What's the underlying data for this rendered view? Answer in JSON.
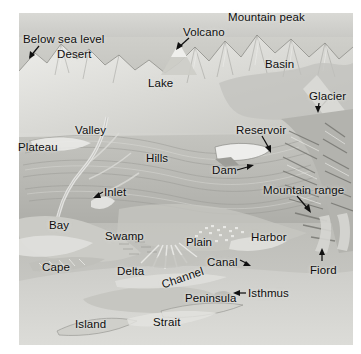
{
  "figure": {
    "type": "physical-geography-terrain-illustration",
    "background_color": "#ffffff",
    "plate_base_color": "#b9b9b6",
    "label_color": "#0d0d0d"
  },
  "labels": [
    {
      "id": "below-sea-level",
      "text": "Below sea level",
      "x": 23,
      "y": 33,
      "has_arrow": true
    },
    {
      "id": "desert",
      "text": "Desert",
      "x": 57,
      "y": 48,
      "has_arrow": false
    },
    {
      "id": "mountain-peak",
      "text": "Mountain peak",
      "x": 228,
      "y": 11,
      "has_arrow": false
    },
    {
      "id": "volcano",
      "text": "Volcano",
      "x": 183,
      "y": 26,
      "has_arrow": true
    },
    {
      "id": "basin",
      "text": "Basin",
      "x": 265,
      "y": 58,
      "has_arrow": false
    },
    {
      "id": "lake",
      "text": "Lake",
      "x": 148,
      "y": 77,
      "has_arrow": false
    },
    {
      "id": "glacier",
      "text": "Glacier",
      "x": 309,
      "y": 90,
      "has_arrow": true
    },
    {
      "id": "valley",
      "text": "Valley",
      "x": 75,
      "y": 124,
      "has_arrow": false
    },
    {
      "id": "reservoir",
      "text": "Reservoir",
      "x": 236,
      "y": 124,
      "has_arrow": true
    },
    {
      "id": "plateau",
      "text": "Plateau",
      "x": 18,
      "y": 141,
      "has_arrow": false
    },
    {
      "id": "hills",
      "text": "Hills",
      "x": 146,
      "y": 152,
      "has_arrow": false
    },
    {
      "id": "dam",
      "text": "Dam",
      "x": 212,
      "y": 164,
      "has_arrow": true
    },
    {
      "id": "inlet",
      "text": "Inlet",
      "x": 104,
      "y": 186,
      "has_arrow": true
    },
    {
      "id": "mountain-range",
      "text": "Mountain range",
      "x": 263,
      "y": 184,
      "has_arrow": true
    },
    {
      "id": "bay",
      "text": "Bay",
      "x": 49,
      "y": 219,
      "has_arrow": false
    },
    {
      "id": "swamp",
      "text": "Swamp",
      "x": 105,
      "y": 230,
      "has_arrow": false
    },
    {
      "id": "plain",
      "text": "Plain",
      "x": 186,
      "y": 236,
      "has_arrow": false
    },
    {
      "id": "harbor",
      "text": "Harbor",
      "x": 251,
      "y": 231,
      "has_arrow": false
    },
    {
      "id": "canal",
      "text": "Canal",
      "x": 207,
      "y": 256,
      "has_arrow": true
    },
    {
      "id": "cape",
      "text": "Cape",
      "x": 42,
      "y": 261,
      "has_arrow": false
    },
    {
      "id": "delta",
      "text": "Delta",
      "x": 117,
      "y": 265,
      "has_arrow": false
    },
    {
      "id": "fiord",
      "text": "Fiord",
      "x": 310,
      "y": 264,
      "has_arrow": true
    },
    {
      "id": "channel",
      "text": "Channel",
      "x": 160,
      "y": 279,
      "has_arrow": false,
      "rotated": true
    },
    {
      "id": "isthmus",
      "text": "Isthmus",
      "x": 248,
      "y": 287,
      "has_arrow": true
    },
    {
      "id": "peninsula",
      "text": "Peninsula",
      "x": 185,
      "y": 292,
      "has_arrow": false
    },
    {
      "id": "strait",
      "text": "Strait",
      "x": 153,
      "y": 316,
      "has_arrow": false
    },
    {
      "id": "island",
      "text": "Island",
      "x": 75,
      "y": 318,
      "has_arrow": false
    }
  ]
}
